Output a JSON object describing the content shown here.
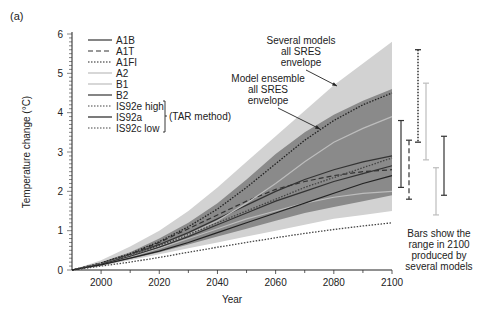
{
  "chart_data": {
    "type": "line",
    "panel_label": "(a)",
    "title": "",
    "xlabel": "Year",
    "ylabel": "Temperature change (°C)",
    "xlim": [
      1990,
      2100
    ],
    "ylim": [
      0,
      6
    ],
    "x_ticks": [
      2000,
      2020,
      2040,
      2060,
      2080,
      2100
    ],
    "y_ticks": [
      0,
      1,
      2,
      3,
      4,
      5,
      6
    ],
    "grid": false,
    "legend_position": "upper-left",
    "legend_group_label": "(TAR method)",
    "x": [
      1990,
      2000,
      2010,
      2020,
      2030,
      2040,
      2050,
      2060,
      2070,
      2080,
      2090,
      2100
    ],
    "envelopes": [
      {
        "name": "Several models all SRES envelope",
        "color": "#d2d2d2",
        "upper": [
          0,
          0.25,
          0.6,
          1.0,
          1.5,
          2.1,
          2.75,
          3.4,
          4.05,
          4.7,
          5.25,
          5.8
        ],
        "lower": [
          0,
          0.1,
          0.25,
          0.4,
          0.55,
          0.7,
          0.85,
          1.0,
          1.15,
          1.3,
          1.4,
          1.5
        ]
      },
      {
        "name": "Model ensemble all SRES envelope",
        "color": "#8a8a8a",
        "upper": [
          0,
          0.2,
          0.45,
          0.8,
          1.2,
          1.7,
          2.3,
          2.95,
          3.5,
          3.95,
          4.3,
          4.6
        ],
        "lower": [
          0,
          0.12,
          0.28,
          0.45,
          0.65,
          0.85,
          1.05,
          1.25,
          1.45,
          1.6,
          1.75,
          1.9
        ]
      }
    ],
    "series": [
      {
        "name": "A1B",
        "style": "solid",
        "color": "#333333",
        "values": [
          0,
          0.17,
          0.38,
          0.65,
          0.95,
          1.3,
          1.65,
          2.0,
          2.3,
          2.55,
          2.75,
          2.9
        ]
      },
      {
        "name": "A1T",
        "style": "dashed",
        "color": "#333333",
        "values": [
          0,
          0.17,
          0.4,
          0.7,
          1.05,
          1.4,
          1.75,
          2.05,
          2.25,
          2.4,
          2.5,
          2.55
        ]
      },
      {
        "name": "A1FI",
        "style": "dotted",
        "color": "#222222",
        "values": [
          0,
          0.18,
          0.42,
          0.72,
          1.1,
          1.55,
          2.1,
          2.7,
          3.3,
          3.8,
          4.2,
          4.5
        ]
      },
      {
        "name": "A2",
        "style": "solid",
        "color": "#bdbdbd",
        "values": [
          0,
          0.16,
          0.36,
          0.6,
          0.9,
          1.25,
          1.7,
          2.2,
          2.75,
          3.25,
          3.6,
          3.9
        ]
      },
      {
        "name": "B1",
        "style": "solid",
        "color": "#bdbdbd",
        "values": [
          0,
          0.15,
          0.33,
          0.55,
          0.8,
          1.05,
          1.3,
          1.5,
          1.7,
          1.85,
          1.95,
          2.0
        ]
      },
      {
        "name": "B2",
        "style": "solid",
        "color": "#333333",
        "values": [
          0,
          0.15,
          0.35,
          0.58,
          0.85,
          1.15,
          1.45,
          1.75,
          2.0,
          2.25,
          2.45,
          2.65
        ]
      },
      {
        "name": "IS92e high",
        "style": "dotted",
        "color": "#444444",
        "values": [
          0,
          0.16,
          0.38,
          0.62,
          0.9,
          1.2,
          1.5,
          1.8,
          2.1,
          2.35,
          2.6,
          2.85
        ]
      },
      {
        "name": "IS92a",
        "style": "solid",
        "color": "#222222",
        "values": [
          0,
          0.13,
          0.3,
          0.48,
          0.7,
          0.95,
          1.2,
          1.45,
          1.7,
          1.95,
          2.2,
          2.4
        ]
      },
      {
        "name": "IS92c low",
        "style": "dotted",
        "color": "#444444",
        "values": [
          0,
          0.1,
          0.2,
          0.32,
          0.45,
          0.58,
          0.7,
          0.82,
          0.93,
          1.03,
          1.12,
          1.2
        ]
      }
    ],
    "range_bars_2100": [
      {
        "scenario": "A1B",
        "style": "solid",
        "color": "#333333",
        "min": 2.1,
        "max": 3.8
      },
      {
        "scenario": "A1T",
        "style": "dashed",
        "color": "#333333",
        "min": 1.8,
        "max": 3.3
      },
      {
        "scenario": "A1FI",
        "style": "dotted",
        "color": "#222222",
        "min": 3.25,
        "max": 5.6
      },
      {
        "scenario": "A2",
        "style": "solid",
        "color": "#bdbdbd",
        "min": 2.8,
        "max": 4.75
      },
      {
        "scenario": "B1",
        "style": "solid",
        "color": "#bdbdbd",
        "min": 1.4,
        "max": 2.6
      },
      {
        "scenario": "B2",
        "style": "solid",
        "color": "#333333",
        "min": 1.9,
        "max": 3.4
      }
    ],
    "annotations": [
      {
        "text": "Several models all SRES envelope",
        "points_to": "outer light-grey envelope"
      },
      {
        "text": "Model ensemble all SRES envelope",
        "points_to": "inner dark-grey envelope"
      },
      {
        "text": "Bars show the range in 2100 produced by several models"
      }
    ]
  },
  "labels": {
    "panel": "(a)",
    "xlabel": "Year",
    "ylabel": "Temperature change (°C)",
    "tar_method": "(TAR method)",
    "ann_several": [
      "Several models",
      "all SRES",
      "envelope"
    ],
    "ann_ensemble": [
      "Model ensemble",
      "all SRES",
      "envelope"
    ],
    "bars_note": [
      "Bars show the",
      "range in 2100",
      "produced by",
      "several models"
    ]
  }
}
